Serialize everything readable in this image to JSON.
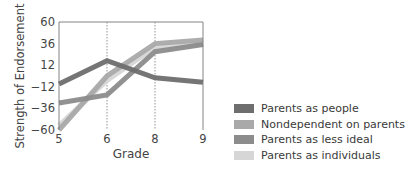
{
  "chart_data": {
    "type": "line",
    "title": "",
    "xlabel": "Grade",
    "ylabel": "Strength of Endorsement",
    "x": [
      5,
      6,
      8,
      9
    ],
    "x_tick_labels": [
      "5",
      "6",
      "8",
      "9"
    ],
    "y_ticks": [
      60,
      36,
      12,
      -12,
      -36,
      -60
    ],
    "y_tick_labels": [
      "60",
      "36",
      "12",
      "−12",
      "−36",
      "−60"
    ],
    "ylim": [
      -60,
      60
    ],
    "grid": "vertical dotted lines at grades 6 and 8",
    "legend_position": "right, lower",
    "series": [
      {
        "name": "Parents as people",
        "color": "#6e6e6e",
        "values": [
          -9,
          17,
          -2,
          -7
        ]
      },
      {
        "name": "Nondependent on parents",
        "color": "#a9a9a9",
        "values": [
          -60,
          0,
          36,
          40
        ]
      },
      {
        "name": "Parents as less ideal",
        "color": "#8c8c8c",
        "values": [
          -30,
          -21,
          27,
          35
        ]
      },
      {
        "name": "Parents as individuals",
        "color": "#d6d6d6",
        "values": [
          -55,
          -5,
          32,
          36
        ]
      }
    ]
  },
  "legend": {
    "items": [
      {
        "label": "Parents as people",
        "color": "#6e6e6e"
      },
      {
        "label": "Nondependent on parents",
        "color": "#a9a9a9"
      },
      {
        "label": "Parents as less ideal",
        "color": "#8c8c8c"
      },
      {
        "label": "Parents as individuals",
        "color": "#d6d6d6"
      }
    ]
  }
}
